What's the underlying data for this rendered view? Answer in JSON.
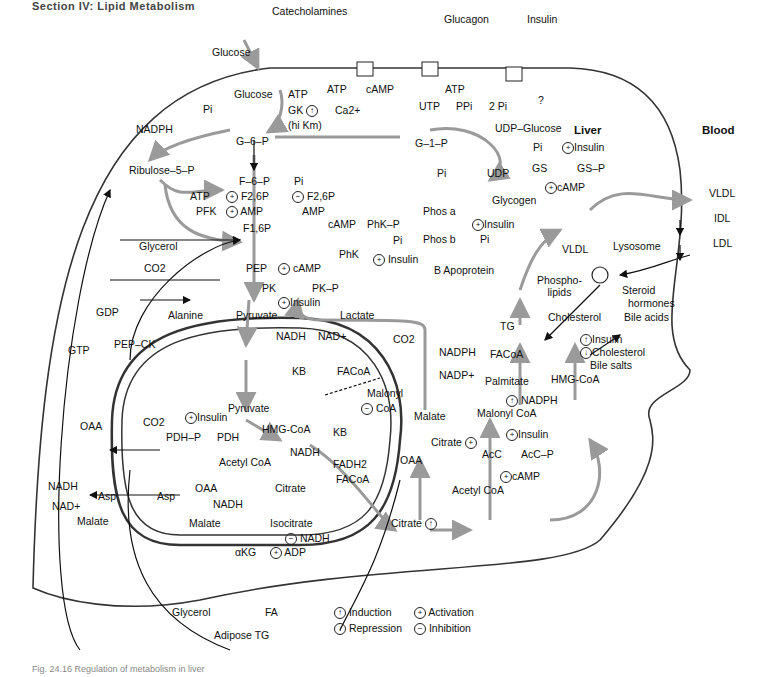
{
  "header": "Section IV: Lipid Metabolism",
  "caption": "Fig. 24.16 Regulation of metabolism in liver",
  "regions": {
    "liver": "Liver",
    "blood": "Blood"
  },
  "receptors": {
    "catecholamines": "Catecholamines",
    "glucagon": "Glucagon",
    "insulin": "Insulin",
    "catecholamine_products": [
      "ATP",
      "cAMP",
      "Ca2+"
    ],
    "glucagon_products": [
      "cAMP",
      "ATP"
    ],
    "insulin_product": "?"
  },
  "glycolysis": {
    "glucose_out": "Glucose",
    "glucose_in": "Glucose",
    "atp": "ATP",
    "gk": "GK",
    "gk_note": "(hi Km)",
    "pi": "Pi",
    "nadph": "NADPH",
    "g6p": "G–6–P",
    "ribulose": "Ribulose–5–P",
    "f6p": "F–6–P",
    "pi2": "Pi",
    "atp2": "ATP",
    "pfk": "PFK",
    "pfk_act1": "F2,6P",
    "pfk_act2": "AMP",
    "fbpase_inh1": "F2,6P",
    "fbpase_inh2": "AMP",
    "f16p": "F1,6P",
    "glycerol": "Glycerol",
    "pep": "PEP",
    "co2": "CO2",
    "gdp": "GDP",
    "gtp": "GTP",
    "pepck": "PEP–CK",
    "pk": "PK",
    "pkp": "PK–P",
    "pk_camp": "cAMP",
    "pk_insulin": "Insulin",
    "alanine": "Alanine",
    "pyruvate": "Pyruvate",
    "lactate": "Lactate",
    "nadh": "NADH",
    "nad": "NAD+"
  },
  "glycogen": {
    "utp": "UTP",
    "ppi": "PPi",
    "two_pi": "2 Pi",
    "udp_glucose": "UDP–Glucose",
    "g1p": "G–1–P",
    "pi": "Pi",
    "udp": "UDP",
    "glycogen": "Glycogen",
    "gs": "GS",
    "gsp": "GS–P",
    "gs_pi": "Pi",
    "gs_insulin": "Insulin",
    "gs_camp": "cAMP",
    "phos_a": "Phos a",
    "phos_b": "Phos b",
    "phos_insulin": "Insulin",
    "phos_pi": "Pi",
    "phk": "PhK",
    "phkp": "PhK–P",
    "phk_camp": "cAMP",
    "phk_pi": "Pi",
    "phk_insulin": "Insulin"
  },
  "mitochondrion": {
    "pyruvate": "Pyruvate",
    "co2": "CO2",
    "insulin": "Insulin",
    "pdhp": "PDH–P",
    "pdh": "PDH",
    "hmgcoa": "HMG-CoA",
    "kb": "KB",
    "acetylcoa": "Acetyl CoA",
    "nadh": "NADH",
    "fadh2": "FADH2",
    "facoa": "FACoA",
    "oaa": "OAA",
    "citrate": "Citrate",
    "malate": "Malate",
    "isocitrate": "Isocitrate",
    "nadh2": "NADH",
    "nadh3": "NADH",
    "akg": "αKG",
    "adp": "ADP"
  },
  "cytosol_left": {
    "oaa": "OAA",
    "nadh": "NADH",
    "nad": "NAD+",
    "asp1": "Asp",
    "asp2": "Asp",
    "malate": "Malate"
  },
  "lipogenesis": {
    "kb": "KB",
    "facoa": "FACoA",
    "malonyl": "Malonyl",
    "coa": "CoA",
    "co2": "CO2",
    "nadph": "NADPH",
    "nadp": "NADP+",
    "malate": "Malate",
    "malonylcoa": "Malonyl CoA",
    "citrate_label": "Citrate",
    "oaa": "OAA",
    "acc": "AcC",
    "accp": "AcC–P",
    "acc_insulin": "Insulin",
    "acc_camp": "cAMP",
    "acetylcoa": "Acetyl CoA",
    "citrate": "Citrate",
    "nadph2": "NADPH",
    "palmitate": "Palmitate",
    "facoa2": "FACoA",
    "tg": "TG",
    "b_apoprotein": "B Apoprotein",
    "phospholipids": "Phospho-\nlipids",
    "vldl": "VLDL"
  },
  "cholesterol": {
    "hmgcoa": "HMG-CoA",
    "cholesterol": "Cholesterol",
    "reg_insulin": "Insulin",
    "reg_cholesterol": "Cholesterol",
    "reg_bile": "Bile salts",
    "steroid": "Steroid",
    "hormones": "hormones",
    "bile_acids": "Bile acids",
    "lysosome": "Lysosome"
  },
  "blood": {
    "vldl": "VLDL",
    "idl": "IDL",
    "ldl": "LDL"
  },
  "adipose": {
    "glycerol": "Glycerol",
    "fa": "FA",
    "tg": "Adipose TG"
  },
  "legend": [
    {
      "symbol": "↑",
      "label": "Induction"
    },
    {
      "symbol": "+",
      "label": "Activation"
    },
    {
      "symbol": "↓",
      "label": "Repression"
    },
    {
      "symbol": "−",
      "label": "Inhibition"
    }
  ],
  "colors": {
    "pathway_gray": "#9a9a9a",
    "line_black": "#111111",
    "membrane": "#333333"
  }
}
